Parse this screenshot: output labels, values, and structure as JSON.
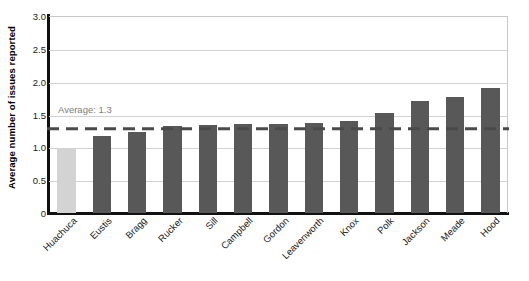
{
  "chart_data": {
    "type": "bar",
    "title": "",
    "xlabel": "",
    "ylabel": "Average number of issues reported",
    "ylim": [
      0,
      3.0
    ],
    "ytick_labels": [
      "3.0",
      "2.5",
      "2.0",
      "1.5",
      "1.0",
      "0.5",
      "0"
    ],
    "ytick_values": [
      3.0,
      2.5,
      2.0,
      1.5,
      1.0,
      0.5,
      0
    ],
    "grid": true,
    "legend": "none",
    "categories": [
      "Huachuca",
      "Eustis",
      "Bragg",
      "Rucker",
      "Sill",
      "Campbell",
      "Gordon",
      "Leavenworth",
      "Knox",
      "Polk",
      "Jackson",
      "Meade",
      "Hood"
    ],
    "values": [
      0.98,
      1.18,
      1.23,
      1.32,
      1.34,
      1.36,
      1.36,
      1.37,
      1.4,
      1.52,
      1.7,
      1.76,
      1.9
    ],
    "highlight_index": 0,
    "annotations": [
      {
        "name": "average-reference-line",
        "label": "Average: 1.3",
        "value": 1.3,
        "style": "dashed"
      }
    ],
    "colors": {
      "bar": "#585858",
      "bar_highlight": "#d3d3d3",
      "average_line": "#4a4a4a",
      "average_label": "#7d7d7d",
      "gridline": "#d2d2d2",
      "axis": "#111111",
      "text": "#1a1a1a"
    }
  }
}
